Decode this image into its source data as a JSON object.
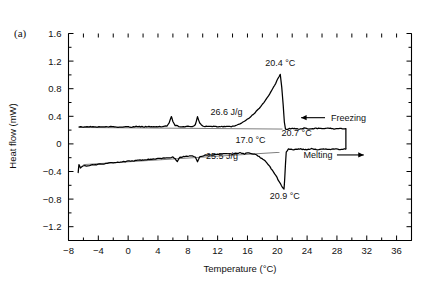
{
  "figure": {
    "panel_label": "(a)",
    "background_color": "#ffffff",
    "line_color": "#000000"
  },
  "chart_data": {
    "type": "line",
    "title": "",
    "subtitle": "",
    "xlabel": "Temperature (°C)",
    "ylabel": "Heat flow (mW)",
    "xlim": [
      -8,
      38
    ],
    "ylim": [
      -1.4,
      1.6
    ],
    "grid": false,
    "legend_position": "none",
    "xticks": [
      -8,
      -4,
      0,
      4,
      8,
      12,
      16,
      20,
      24,
      28,
      32,
      36
    ],
    "xtick_labels": [
      "−8",
      "−4",
      "0",
      "4",
      "8",
      "12",
      "16",
      "20",
      "24",
      "28",
      "32",
      "36"
    ],
    "x_minor_tick_step": 2,
    "yticks": [
      1.6,
      1.2,
      0.8,
      0.4,
      0,
      -0.4,
      -0.8,
      -1.2
    ],
    "ytick_labels": [
      "1.6",
      "1.2",
      "0.8",
      "0.4",
      "0",
      "−0.4",
      "−0.8",
      "−1.2"
    ],
    "y_minor_tick_step": 0.2,
    "series": [
      {
        "name": "Freezing",
        "points": [
          [
            -6.6,
            0.25
          ],
          [
            -6.0,
            0.245
          ],
          [
            -5.2,
            0.25
          ],
          [
            -4.4,
            0.243
          ],
          [
            -3.6,
            0.252
          ],
          [
            -2.8,
            0.246
          ],
          [
            -2.0,
            0.252
          ],
          [
            -1.2,
            0.244
          ],
          [
            -0.4,
            0.25
          ],
          [
            0.4,
            0.246
          ],
          [
            1.2,
            0.253
          ],
          [
            2.0,
            0.247
          ],
          [
            2.8,
            0.251
          ],
          [
            3.6,
            0.246
          ],
          [
            4.2,
            0.254
          ],
          [
            4.8,
            0.25
          ],
          [
            5.2,
            0.262
          ],
          [
            5.5,
            0.3
          ],
          [
            5.8,
            0.4
          ],
          [
            6.0,
            0.33
          ],
          [
            6.3,
            0.27
          ],
          [
            6.8,
            0.255
          ],
          [
            7.4,
            0.25
          ],
          [
            8.0,
            0.252
          ],
          [
            8.6,
            0.248
          ],
          [
            9.0,
            0.27
          ],
          [
            9.3,
            0.4
          ],
          [
            9.6,
            0.3
          ],
          [
            10.0,
            0.258
          ],
          [
            10.8,
            0.25
          ],
          [
            11.6,
            0.253
          ],
          [
            12.4,
            0.249
          ],
          [
            13.2,
            0.255
          ],
          [
            14.0,
            0.252
          ],
          [
            14.6,
            0.27
          ],
          [
            15.2,
            0.3
          ],
          [
            15.8,
            0.34
          ],
          [
            16.4,
            0.39
          ],
          [
            17.0,
            0.45
          ],
          [
            17.6,
            0.52
          ],
          [
            18.2,
            0.6
          ],
          [
            18.8,
            0.69
          ],
          [
            19.3,
            0.78
          ],
          [
            19.8,
            0.88
          ],
          [
            20.1,
            0.95
          ],
          [
            20.4,
            1.0
          ],
          [
            20.6,
            0.82
          ],
          [
            20.8,
            0.55
          ],
          [
            20.95,
            0.32
          ],
          [
            21.1,
            0.21
          ],
          [
            21.4,
            0.215
          ],
          [
            22.0,
            0.225
          ],
          [
            22.8,
            0.215
          ],
          [
            23.6,
            0.228
          ],
          [
            24.4,
            0.216
          ],
          [
            25.2,
            0.227
          ],
          [
            26.0,
            0.217
          ],
          [
            26.8,
            0.226
          ],
          [
            27.6,
            0.218
          ],
          [
            28.4,
            0.228
          ],
          [
            28.9,
            0.22
          ],
          [
            29.2,
            0.22
          ]
        ],
        "baseline": [
          [
            -6.6,
            0.238
          ],
          [
            20.7,
            0.215
          ]
        ]
      },
      {
        "name": "Melting",
        "points": [
          [
            -6.7,
            -0.42
          ],
          [
            -6.6,
            -0.3
          ],
          [
            -6.4,
            -0.345
          ],
          [
            -6.0,
            -0.32
          ],
          [
            -5.4,
            -0.315
          ],
          [
            -4.8,
            -0.305
          ],
          [
            -4.2,
            -0.3
          ],
          [
            -3.6,
            -0.292
          ],
          [
            -3.0,
            -0.285
          ],
          [
            -2.4,
            -0.278
          ],
          [
            -1.8,
            -0.272
          ],
          [
            -1.2,
            -0.265
          ],
          [
            -0.6,
            -0.258
          ],
          [
            0.0,
            -0.252
          ],
          [
            0.8,
            -0.244
          ],
          [
            1.6,
            -0.236
          ],
          [
            2.4,
            -0.228
          ],
          [
            3.2,
            -0.221
          ],
          [
            4.0,
            -0.213
          ],
          [
            4.8,
            -0.206
          ],
          [
            5.6,
            -0.198
          ],
          [
            6.0,
            -0.19
          ],
          [
            6.3,
            -0.215
          ],
          [
            6.6,
            -0.26
          ],
          [
            6.9,
            -0.2
          ],
          [
            7.4,
            -0.185
          ],
          [
            8.0,
            -0.178
          ],
          [
            8.6,
            -0.172
          ],
          [
            9.0,
            -0.19
          ],
          [
            9.3,
            -0.255
          ],
          [
            9.6,
            -0.19
          ],
          [
            10.2,
            -0.165
          ],
          [
            11.0,
            -0.158
          ],
          [
            11.8,
            -0.152
          ],
          [
            12.6,
            -0.145
          ],
          [
            13.4,
            -0.14
          ],
          [
            14.0,
            -0.155
          ],
          [
            14.4,
            -0.135
          ],
          [
            15.0,
            -0.13
          ],
          [
            15.6,
            -0.145
          ],
          [
            16.0,
            -0.125
          ],
          [
            16.6,
            -0.14
          ],
          [
            17.0,
            -0.15
          ],
          [
            17.4,
            -0.175
          ],
          [
            17.9,
            -0.21
          ],
          [
            18.4,
            -0.25
          ],
          [
            18.8,
            -0.3
          ],
          [
            19.2,
            -0.36
          ],
          [
            19.5,
            -0.41
          ],
          [
            19.8,
            -0.45
          ],
          [
            20.1,
            -0.52
          ],
          [
            20.4,
            -0.57
          ],
          [
            20.7,
            -0.63
          ],
          [
            20.9,
            -0.66
          ],
          [
            21.0,
            -0.5
          ],
          [
            21.1,
            -0.3
          ],
          [
            21.2,
            -0.12
          ],
          [
            21.5,
            -0.075
          ],
          [
            22.2,
            -0.085
          ],
          [
            23.0,
            -0.072
          ],
          [
            23.8,
            -0.085
          ],
          [
            24.6,
            -0.07
          ],
          [
            25.4,
            -0.084
          ],
          [
            26.2,
            -0.07
          ],
          [
            27.0,
            -0.083
          ],
          [
            27.8,
            -0.07
          ],
          [
            28.6,
            -0.082
          ],
          [
            29.0,
            -0.075
          ],
          [
            29.2,
            -0.075
          ]
        ],
        "baseline": [
          [
            -6.0,
            -0.3
          ],
          [
            20.3,
            -0.122
          ]
        ]
      }
    ],
    "connector": {
      "name": "curve-join",
      "from": [
        29.2,
        0.22
      ],
      "to": [
        29.2,
        -0.075
      ]
    },
    "annotations": [
      {
        "name": "freezing-peak-temp",
        "text": "20.4 °C",
        "x": 20.4,
        "y": 1.13,
        "anchor": "middle"
      },
      {
        "name": "freezing-enthalpy",
        "text": "26.6 J/g",
        "x": 13.2,
        "y": 0.42,
        "anchor": "middle"
      },
      {
        "name": "freezing-onset-temp",
        "text": "20.7 °C",
        "x": 22.6,
        "y": 0.12,
        "anchor": "middle"
      },
      {
        "name": "melting-onset-temp",
        "text": "17.0 °C",
        "x": 16.4,
        "y": 0.02,
        "anchor": "middle"
      },
      {
        "name": "melting-enthalpy",
        "text": "25.5 J/g",
        "x": 12.6,
        "y": -0.225,
        "anchor": "middle"
      },
      {
        "name": "melting-peak-temp",
        "text": "20.9 °C",
        "x": 21.0,
        "y": -0.8,
        "anchor": "middle"
      }
    ],
    "direction_markers": [
      {
        "name": "freezing-direction",
        "label": "Freezing",
        "arrow_direction": "left",
        "arrow_from_x": 26.4,
        "arrow_to_x": 23.2,
        "y": 0.38,
        "label_x": 27.2
      },
      {
        "name": "melting-direction",
        "label": "Melting",
        "arrow_direction": "right",
        "arrow_from_x": 28.0,
        "arrow_to_x": 31.6,
        "y": -0.16,
        "label_x": 27.4
      }
    ]
  }
}
